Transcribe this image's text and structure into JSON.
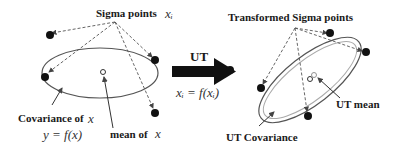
{
  "left_panel": {
    "sigma_points_label": "Sigma points",
    "sigma_points_symbol": "xᵢ",
    "covariance_label": "Covariance of",
    "covariance_symbol": "x",
    "function_label": "y = f(x)",
    "mean_label": "mean of",
    "mean_symbol": "x"
  },
  "center": {
    "transform_label": "UT",
    "transform_equation": "xᵢ = f(xᵢ)"
  },
  "right_panel": {
    "sigma_points_label": "Transformed Sigma points",
    "mean_label": "UT mean",
    "covariance_label": "UT Covariance"
  },
  "colors": {
    "line": "#555555",
    "point": "#111111",
    "arrow": "#111111",
    "text": "#1a1a1a"
  }
}
